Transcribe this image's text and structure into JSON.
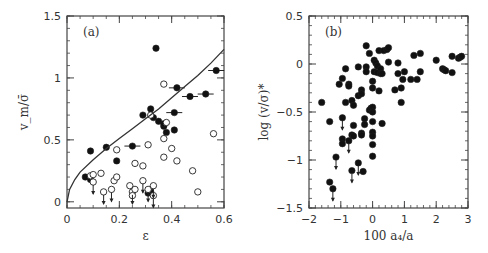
{
  "chart_data": [
    {
      "panel": "(a)",
      "type": "scatter",
      "xlabel": "ε",
      "ylabel": "v_m/σ̄",
      "xlim": [
        0,
        0.6
      ],
      "ylim": [
        -0.05,
        1.5
      ],
      "xticks": [
        "0",
        "0.2",
        "0.4",
        "0.6"
      ],
      "xtick_values": [
        0,
        0.2,
        0.4,
        0.6
      ],
      "yticks": [
        "0",
        "0.5",
        "1",
        "1.5"
      ],
      "ytick_values": [
        0,
        0.5,
        1,
        1.5
      ],
      "grid": false,
      "legend": null,
      "series": [
        {
          "name": "filled",
          "marker": "filled-circle",
          "points": [
            [
              0.07,
              0.2
            ],
            [
              0.09,
              0.41
            ],
            [
              0.09,
              0.18
            ],
            [
              0.15,
              0.44
            ],
            [
              0.19,
              0.33
            ],
            [
              0.25,
              0.45
            ],
            [
              0.29,
              0.7
            ],
            [
              0.32,
              0.75
            ],
            [
              0.33,
              0.68
            ],
            [
              0.34,
              1.24
            ],
            [
              0.35,
              0.65
            ],
            [
              0.37,
              0.61
            ],
            [
              0.37,
              0.63
            ],
            [
              0.38,
              0.56
            ],
            [
              0.41,
              0.58
            ],
            [
              0.41,
              0.72
            ],
            [
              0.42,
              0.92
            ],
            [
              0.47,
              0.85
            ],
            [
              0.53,
              0.87
            ],
            [
              0.57,
              1.06
            ],
            [
              0.31,
              0.07
            ],
            [
              0.32,
              0.08
            ]
          ],
          "horizontal_error_points": [
            [
              0.25,
              0.45
            ],
            [
              0.41,
              0.72
            ],
            [
              0.42,
              0.92
            ],
            [
              0.47,
              0.85
            ],
            [
              0.53,
              0.87
            ],
            [
              0.57,
              1.06
            ]
          ]
        },
        {
          "name": "open",
          "marker": "open-circle",
          "points": [
            [
              0.09,
              0.21
            ],
            [
              0.1,
              0.22
            ],
            [
              0.1,
              0.16
            ],
            [
              0.13,
              0.23
            ],
            [
              0.14,
              0.08
            ],
            [
              0.17,
              0.1
            ],
            [
              0.18,
              0.17
            ],
            [
              0.19,
              0.2
            ],
            [
              0.19,
              0.42
            ],
            [
              0.24,
              0.13
            ],
            [
              0.25,
              0.08
            ],
            [
              0.25,
              0.05
            ],
            [
              0.26,
              0.31
            ],
            [
              0.26,
              0.1
            ],
            [
              0.29,
              0.29
            ],
            [
              0.29,
              0.17
            ],
            [
              0.31,
              0.46
            ],
            [
              0.31,
              0.1
            ],
            [
              0.33,
              0.13
            ],
            [
              0.33,
              0.05
            ],
            [
              0.37,
              0.95
            ],
            [
              0.37,
              0.51
            ],
            [
              0.37,
              0.36
            ],
            [
              0.38,
              0.64
            ],
            [
              0.4,
              0.43
            ],
            [
              0.42,
              0.33
            ],
            [
              0.48,
              0.25
            ],
            [
              0.5,
              0.08
            ],
            [
              0.56,
              0.55
            ],
            [
              0.32,
              0.7
            ]
          ]
        },
        {
          "name": "upper-limit arrows",
          "marker": "down-arrow",
          "points": [
            [
              0.1,
              0.16
            ],
            [
              0.14,
              0.08
            ],
            [
              0.17,
              0.1
            ],
            [
              0.25,
              0.08
            ],
            [
              0.29,
              0.17
            ],
            [
              0.31,
              0.1
            ],
            [
              0.33,
              0.13
            ],
            [
              0.33,
              0.05
            ]
          ]
        },
        {
          "name": "model curve",
          "type": "line",
          "x": [
            0.0,
            0.01,
            0.03,
            0.05,
            0.1,
            0.15,
            0.2,
            0.25,
            0.3,
            0.35,
            0.4,
            0.45,
            0.5,
            0.55,
            0.6
          ],
          "values": [
            0.0,
            0.1,
            0.18,
            0.24,
            0.34,
            0.43,
            0.51,
            0.59,
            0.67,
            0.75,
            0.84,
            0.93,
            1.02,
            1.12,
            1.23
          ]
        }
      ]
    },
    {
      "panel": "(b)",
      "type": "scatter",
      "xlabel": "100 a₄/a",
      "ylabel": "log (v/σ)*",
      "xlim": [
        -2,
        3
      ],
      "ylim": [
        -1.5,
        0.5
      ],
      "xticks": [
        "−2",
        "−1",
        "0",
        "1",
        "2",
        "3"
      ],
      "xtick_values": [
        -2,
        -1,
        0,
        1,
        2,
        3
      ],
      "yticks": [
        "−1.5",
        "−1",
        "−0.5",
        "0",
        "0.5"
      ],
      "ytick_values": [
        -1.5,
        -1,
        -0.5,
        0,
        0.5
      ],
      "grid": false,
      "legend": null,
      "series": [
        {
          "name": "filled",
          "marker": "filled-circle",
          "points": [
            [
              -1.6,
              -0.4
            ],
            [
              -1.35,
              -0.6
            ],
            [
              -1.35,
              -1.23
            ],
            [
              -1.25,
              -1.3
            ],
            [
              -1.15,
              -0.97
            ],
            [
              -1.05,
              -0.21
            ],
            [
              -0.95,
              -0.15
            ],
            [
              -0.95,
              -0.56
            ],
            [
              -0.95,
              -0.78
            ],
            [
              -0.95,
              -0.83
            ],
            [
              -0.85,
              -0.05
            ],
            [
              -0.85,
              -0.4
            ],
            [
              -0.75,
              -0.21
            ],
            [
              -0.75,
              -0.23
            ],
            [
              -0.75,
              -0.8
            ],
            [
              -0.65,
              -0.38
            ],
            [
              -0.65,
              -0.74
            ],
            [
              -0.65,
              -1.11
            ],
            [
              -0.6,
              -0.43
            ],
            [
              -0.6,
              -0.64
            ],
            [
              -0.6,
              -0.75
            ],
            [
              -0.45,
              -0.03
            ],
            [
              -0.45,
              -0.33
            ],
            [
              -0.45,
              -1.03
            ],
            [
              -0.35,
              -0.27
            ],
            [
              -0.35,
              -0.31
            ],
            [
              -0.35,
              -0.72
            ],
            [
              -0.35,
              -0.74
            ],
            [
              -0.3,
              -1.12
            ],
            [
              -0.25,
              -0.57
            ],
            [
              -0.25,
              -0.63
            ],
            [
              -0.2,
              0.19
            ],
            [
              -0.2,
              -0.03
            ],
            [
              -0.2,
              -0.08
            ],
            [
              -0.1,
              0.11
            ],
            [
              -0.1,
              -0.48
            ],
            [
              -0.05,
              -0.46
            ],
            [
              0.0,
              -0.18
            ],
            [
              0.0,
              -0.25
            ],
            [
              0.0,
              -0.45
            ],
            [
              0.0,
              -0.5
            ],
            [
              0.0,
              -0.6
            ],
            [
              0.0,
              -0.71
            ],
            [
              0.0,
              -0.75
            ],
            [
              0.0,
              -0.84
            ],
            [
              0.0,
              -0.96
            ],
            [
              0.05,
              0.04
            ],
            [
              0.05,
              -0.08
            ],
            [
              0.1,
              0.01
            ],
            [
              0.15,
              -0.02
            ],
            [
              0.15,
              -0.09
            ],
            [
              0.2,
              0.14
            ],
            [
              0.2,
              -0.28
            ],
            [
              0.25,
              -0.05
            ],
            [
              0.25,
              -0.1
            ],
            [
              0.3,
              -0.1
            ],
            [
              0.3,
              -0.62
            ],
            [
              0.35,
              0.14
            ],
            [
              0.45,
              0.15
            ],
            [
              0.5,
              0.17
            ],
            [
              0.5,
              0.02
            ],
            [
              0.7,
              -0.27
            ],
            [
              0.8,
              0.01
            ],
            [
              0.8,
              -0.1
            ],
            [
              0.9,
              -0.25
            ],
            [
              0.9,
              -0.4
            ],
            [
              0.95,
              -0.16
            ],
            [
              1.0,
              -0.08
            ],
            [
              1.2,
              -0.16
            ],
            [
              1.3,
              0.09
            ],
            [
              1.4,
              -0.16
            ],
            [
              1.5,
              0.11
            ],
            [
              1.5,
              -0.08
            ],
            [
              2.0,
              0.04
            ],
            [
              2.2,
              -0.05
            ],
            [
              2.25,
              -0.06
            ],
            [
              2.3,
              -0.07
            ],
            [
              2.5,
              0.08
            ],
            [
              2.5,
              -0.09
            ],
            [
              2.7,
              0.06
            ],
            [
              2.75,
              0.07
            ],
            [
              2.8,
              0.08
            ]
          ]
        },
        {
          "name": "upper-limit arrows",
          "marker": "down-arrow",
          "points": [
            [
              -1.25,
              -1.3
            ],
            [
              -1.15,
              -0.97
            ],
            [
              -0.95,
              -0.56
            ],
            [
              -0.75,
              -0.8
            ],
            [
              -0.65,
              -1.11
            ],
            [
              -0.45,
              -1.03
            ]
          ]
        }
      ]
    }
  ],
  "figure": {
    "panel_a_label": "(a)",
    "panel_b_label": "(b)"
  }
}
